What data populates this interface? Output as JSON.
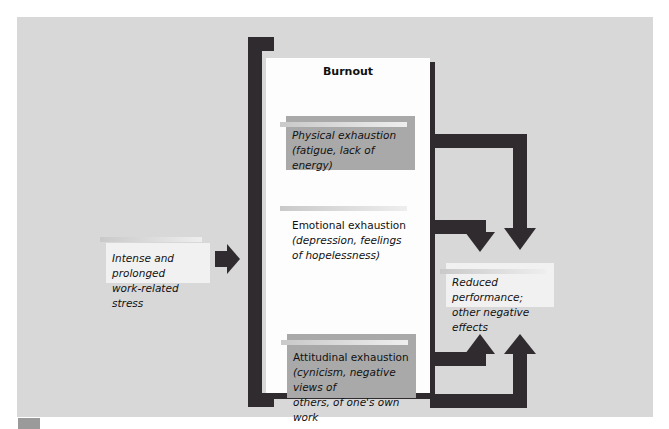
{
  "diagram": {
    "title": "Burnout",
    "input": {
      "line1": "Intense and prolonged",
      "line2": "work-related stress"
    },
    "components": [
      {
        "line1": "Physical exhaustion",
        "line2": "(fatigue, lack of energy)",
        "line3": ""
      },
      {
        "line1": "Emotional exhaustion",
        "line2": "(depression, feelings",
        "line3": "of hopelessness)"
      },
      {
        "line1": "Attitudinal exhaustion",
        "line2": "(cynicism, negative views of",
        "line3": "others, of one's own work"
      },
      {
        "line1": "Feelings of low",
        "line2": "personal accomplishment",
        "line3": ""
      }
    ],
    "output": {
      "line1": "Reduced performance;",
      "line2": "other negative effects"
    },
    "colors": {
      "panel": "#d8d8d8",
      "arrow": "#2f2b2e",
      "component_fill": "#a9a9a9",
      "burnout_bg": "#fdfdfd"
    }
  }
}
